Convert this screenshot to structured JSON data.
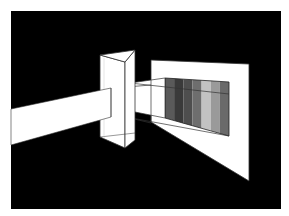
{
  "diagram": {
    "colors": {
      "page_background": "#ffffff",
      "scene_background": "#000000",
      "beam": "#ffffff",
      "prism": "#ffffff",
      "screen": "#ffffff",
      "outline": "#222222"
    },
    "spectrum_bands": [
      {
        "name": "band-1",
        "color": "#5a5a5a"
      },
      {
        "name": "band-2",
        "color": "#3a3a3a"
      },
      {
        "name": "band-3",
        "color": "#4e4e4e"
      },
      {
        "name": "band-4",
        "color": "#6e6e6e"
      },
      {
        "name": "band-5",
        "color": "#c2c2c2"
      },
      {
        "name": "band-6",
        "color": "#9a9a9a"
      },
      {
        "name": "band-7",
        "color": "#6a6a6a"
      }
    ],
    "elements": [
      "incoming light beam",
      "triangular prism",
      "refracted beam",
      "screen",
      "spectrum"
    ]
  }
}
